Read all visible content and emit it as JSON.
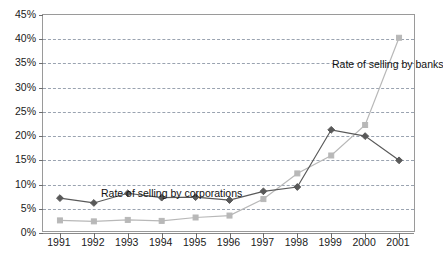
{
  "chart_data": {
    "type": "line",
    "title": "",
    "xlabel": "",
    "ylabel": "",
    "x": [
      1991,
      1992,
      1993,
      1994,
      1995,
      1996,
      1997,
      1998,
      1999,
      2000,
      2001
    ],
    "categories": [
      "1991",
      "1992",
      "1993",
      "1994",
      "1995",
      "1996",
      "1997",
      "1998",
      "1999",
      "2000",
      "2001"
    ],
    "ylim": [
      0,
      45
    ],
    "yticks": [
      0,
      5,
      10,
      15,
      20,
      25,
      30,
      35,
      40,
      45
    ],
    "ytick_labels": [
      "0%",
      "5%",
      "10%",
      "15%",
      "20%",
      "25%",
      "30%",
      "35%",
      "40%",
      "45%"
    ],
    "grid": true,
    "legend_position": "inline-annotations",
    "series": [
      {
        "name": "Rate of selling by corporations",
        "color": "#595959",
        "marker": "diamond",
        "values": [
          7.2,
          6.2,
          8.2,
          7.3,
          7.4,
          6.8,
          8.6,
          9.5,
          21.3,
          20.0,
          15.0
        ]
      },
      {
        "name": "Rate of selling by banks",
        "color": "#b8b8b8",
        "marker": "square",
        "values": [
          2.6,
          2.4,
          2.7,
          2.5,
          3.2,
          3.6,
          7.0,
          12.3,
          16.0,
          22.3,
          40.3
        ]
      }
    ],
    "annotations": [
      {
        "text": "Rate of selling by corporations",
        "series": "Rate of selling by corporations"
      },
      {
        "text": "Rate of selling by banks",
        "series": "Rate of selling by banks"
      }
    ]
  },
  "axes": {
    "y_tick_labels": [
      "45%",
      "40%",
      "35%",
      "30%",
      "25%",
      "20%",
      "15%",
      "10%",
      "5%",
      "0%"
    ],
    "x_tick_labels": [
      "1991",
      "1992",
      "1993",
      "1994",
      "1995",
      "1996",
      "1997",
      "1998",
      "1999",
      "2000",
      "2001"
    ]
  },
  "annotations": {
    "corporations_label": "Rate of selling by corporations",
    "banks_label": "Rate of selling by banks"
  },
  "colors": {
    "corporations": "#595959",
    "banks": "#b8b8b8",
    "gridline": "#9aa3b0",
    "frame": "#9a9a9a",
    "text": "#1a1a1a"
  }
}
